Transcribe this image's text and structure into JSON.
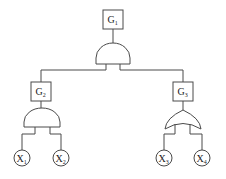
{
  "diagram": {
    "type": "fault-tree",
    "colors": {
      "stroke": "#4a4a4a",
      "text": "#222222",
      "background": "#ffffff"
    },
    "nodes": [
      {
        "id": "G1",
        "kind": "event-box",
        "label": "G",
        "subscript": "1"
      },
      {
        "id": "G2",
        "kind": "event-box",
        "label": "G",
        "subscript": "2"
      },
      {
        "id": "G3",
        "kind": "event-box",
        "label": "G",
        "subscript": "3"
      },
      {
        "id": "X1",
        "kind": "basic-event",
        "label": "X",
        "subscript": "1"
      },
      {
        "id": "X2",
        "kind": "basic-event",
        "label": "X",
        "subscript": "2"
      },
      {
        "id": "X3",
        "kind": "basic-event",
        "label": "X",
        "subscript": "3"
      },
      {
        "id": "X4",
        "kind": "basic-event",
        "label": "X",
        "subscript": "4"
      }
    ],
    "gates": [
      {
        "id": "gate-G1",
        "type": "AND",
        "output": "G1",
        "inputs": [
          "G2",
          "G3"
        ]
      },
      {
        "id": "gate-G2",
        "type": "AND",
        "output": "G2",
        "inputs": [
          "X1",
          "X2"
        ]
      },
      {
        "id": "gate-G3",
        "type": "OR",
        "output": "G3",
        "inputs": [
          "X3",
          "X4"
        ]
      }
    ]
  }
}
